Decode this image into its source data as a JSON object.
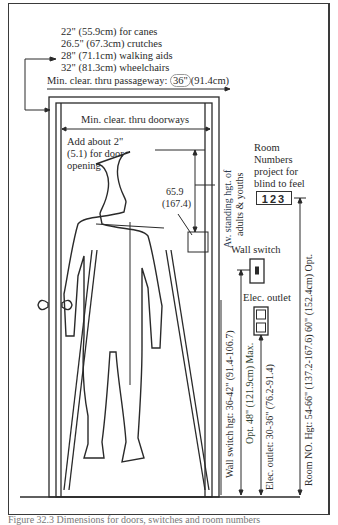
{
  "clearances": {
    "canes": "22\" (55.9cm) for canes",
    "crutches": "26.5\" (67.3cm) crutches",
    "walking_aids": "28\" (71.1cm) walking aids",
    "wheelchairs": "32\" (81.3cm) wheelchairs",
    "passageway_label": "Min. clear. thru passageway:",
    "passageway_value": "36\"",
    "passageway_metric": "(91.4cm)"
  },
  "door": {
    "min_clear_label": "Min. clear. thru doorways",
    "add_note_line1": "Add about 2\"",
    "add_note_line2": "(5.1) for door",
    "add_note_line3": "opening"
  },
  "standing_height": {
    "value": "65.9",
    "metric": "(167.4)",
    "label_line1": "Av. standing hgt. of",
    "label_line2": "adults & youths"
  },
  "room_numbers": {
    "line1": "Room",
    "line2": "Numbers",
    "line3": "project for",
    "line4": "blind to feel",
    "sample": "123"
  },
  "fixtures": {
    "wall_switch": "Wall switch",
    "elec_outlet": "Elec. outlet"
  },
  "vertical_dims": {
    "wall_switch_hgt": "Wall switch hgt: 36-42\" (91.4-106.7)",
    "opt_max": "Opt. 48\" (121.9cm) Max.",
    "outlet_hgt": "Elec. outlet: 30-36\" (76.2-91.4)",
    "room_no_hgt": "Room NO. Hgt: 54-66\" (137.2-167.6) 60\" (152.4cm) Opt."
  },
  "caption": "Figure 32.3 Dimensions for doors, switches and room numbers"
}
